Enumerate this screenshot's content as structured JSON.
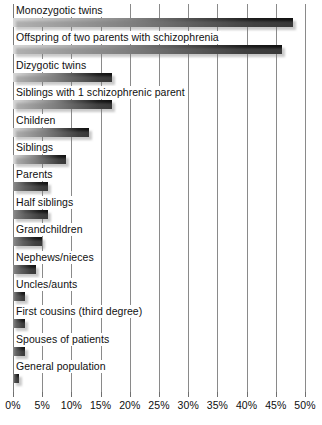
{
  "chart_data": {
    "type": "bar",
    "orientation": "horizontal",
    "title": "",
    "subtitle": "",
    "xlabel": "",
    "ylabel": "",
    "xlim": [
      0,
      50
    ],
    "xtick_labels": [
      "0%",
      "5%",
      "10%",
      "15%",
      "20%",
      "25%",
      "30%",
      "35%",
      "40%",
      "45%",
      "50%"
    ],
    "xticks": [
      0,
      5,
      10,
      15,
      20,
      25,
      30,
      35,
      40,
      45,
      50
    ],
    "grid": true,
    "legend": "none",
    "value_unit": "%",
    "categories": [
      "Monozygotic twins",
      "Offspring of two parents with schizophrenia",
      "Dizygotic twins",
      "Siblings with 1 schizophrenic parent",
      "Children",
      "Siblings",
      "Parents",
      "Half siblings",
      "Grandchildren",
      "Nephews/nieces",
      "Uncles/aunts",
      "First cousins (third degree)",
      "Spouses of patients",
      "General population"
    ],
    "values": [
      48,
      46,
      17,
      17,
      13,
      9,
      6,
      6,
      5,
      4,
      2,
      2,
      2,
      1
    ]
  },
  "axis": {
    "ticks": [
      {
        "label": "0%",
        "value": 0
      },
      {
        "label": "5%",
        "value": 5
      },
      {
        "label": "10%",
        "value": 10
      },
      {
        "label": "15%",
        "value": 15
      },
      {
        "label": "20%",
        "value": 20
      },
      {
        "label": "25%",
        "value": 25
      },
      {
        "label": "30%",
        "value": 30
      },
      {
        "label": "35%",
        "value": 35
      },
      {
        "label": "40%",
        "value": 40
      },
      {
        "label": "45%",
        "value": 45
      },
      {
        "label": "50%",
        "value": 50
      }
    ]
  },
  "colors": {
    "bar_light": "#d8d8d8",
    "bar_dark": "#101010",
    "gridline": "#8a8a8a",
    "text": "#101010",
    "background": "#ffffff"
  }
}
